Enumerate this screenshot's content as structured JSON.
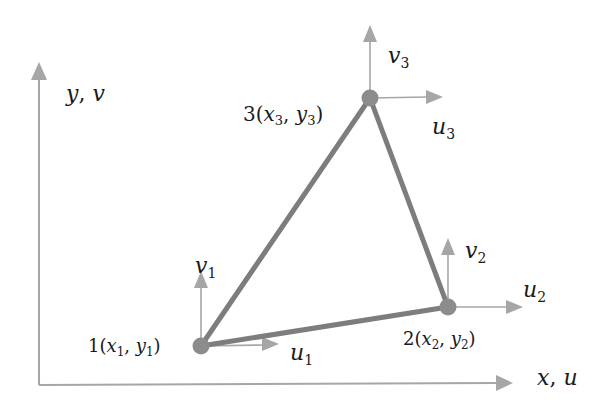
{
  "colors": {
    "edge": "#7d7d7d",
    "node": "#8c8c8c",
    "arrow": "#a6a6a6",
    "axis": "#a6a6a6",
    "text": "#1a1a1a"
  },
  "axes": {
    "y_label": {
      "var": "y",
      "sep": ", ",
      "disp": "v"
    },
    "x_label": {
      "var": "x",
      "sep": ", ",
      "disp": "u"
    }
  },
  "nodes": [
    {
      "id": "1",
      "prefix": "1(",
      "x": "x",
      "xs": "1",
      "comma": ", ",
      "y": "y",
      "ys": "1",
      "suffix": ")",
      "u": "u",
      "us": "1",
      "v": "v",
      "vs": "1"
    },
    {
      "id": "2",
      "prefix": "2(",
      "x": "x",
      "xs": "2",
      "comma": ", ",
      "y": "y",
      "ys": "2",
      "suffix": ")",
      "u": "u",
      "us": "2",
      "v": "v",
      "vs": "2"
    },
    {
      "id": "3",
      "prefix": "3(",
      "x": "x",
      "xs": "3",
      "comma": ", ",
      "y": "y",
      "ys": "3",
      "suffix": ")",
      "u": "u",
      "us": "3",
      "v": "v",
      "vs": "3"
    }
  ]
}
